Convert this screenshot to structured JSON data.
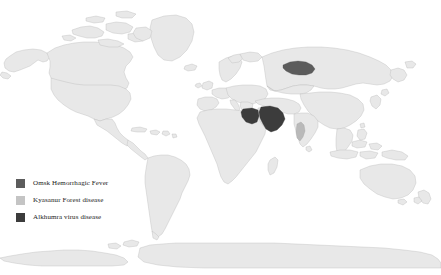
{
  "figure": {
    "type": "choropleth-world-map",
    "title": "",
    "background_color": "#ffffff",
    "land_color": "#e8e8e8",
    "border_color": "#b5b5b5",
    "projection": "equirectangular"
  },
  "legend": {
    "position": "bottom-left",
    "items": [
      {
        "label": "Omsk Hemorrhagic Fever",
        "color": "#5c5c5c",
        "swatch_name": "legend-swatch-omsk",
        "regions": [
          "Omsk Oblast region, Western Siberia, Russia"
        ]
      },
      {
        "label": "Kyasanur Forest disease",
        "color": "#c4c4c4",
        "swatch_name": "legend-swatch-kyasanur",
        "regions": [
          "Karnataka, southwestern India"
        ]
      },
      {
        "label": "Alkhumra virus disease",
        "color": "#3c3c3c",
        "swatch_name": "legend-swatch-alkhumra",
        "regions": [
          "Saudi Arabia",
          "Egypt"
        ]
      }
    ]
  },
  "map": {
    "highlighted_regions": [
      {
        "name": "Western Siberia (Omsk region), Russia",
        "disease": "Omsk Hemorrhagic Fever",
        "color": "#5c5c5c"
      },
      {
        "name": "Karnataka, India",
        "disease": "Kyasanur Forest disease",
        "color": "#b9b9b9"
      },
      {
        "name": "Saudi Arabia",
        "disease": "Alkhumra virus disease",
        "color": "#3c3c3c"
      },
      {
        "name": "Egypt",
        "disease": "Alkhumra virus disease",
        "color": "#3c3c3c"
      }
    ],
    "continents_shown": [
      "North America",
      "South America",
      "Europe",
      "Africa",
      "Asia",
      "Oceania",
      "Antarctica"
    ]
  }
}
